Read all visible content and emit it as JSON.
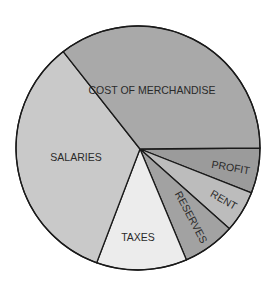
{
  "chart_data": {
    "type": "pie",
    "title": "",
    "start_angle_deg": 0,
    "direction": "clockwise",
    "slices": [
      {
        "label": "PROFIT",
        "value": 6,
        "color": "#9b9b9b"
      },
      {
        "label": "RENT",
        "value": 5.5,
        "color": "#bcbcbc"
      },
      {
        "label": "RESERVES",
        "value": 7,
        "color": "#a2a2a2"
      },
      {
        "label": "TAXES",
        "value": 12,
        "color": "#ececec"
      },
      {
        "label": "SALARIES",
        "value": 34,
        "color": "#c9c9c9"
      },
      {
        "label": "COST OF MERCHANDISE",
        "value": 35.5,
        "color": "#a9a9a9"
      }
    ],
    "legend": "none",
    "labels_inside": true
  },
  "labels": {
    "cost": "COST OF MERCHANDISE",
    "salaries": "SALARIES",
    "taxes": "TAXES",
    "reserves": "RESERVES",
    "rent": "RENT",
    "profit": "PROFIT"
  }
}
